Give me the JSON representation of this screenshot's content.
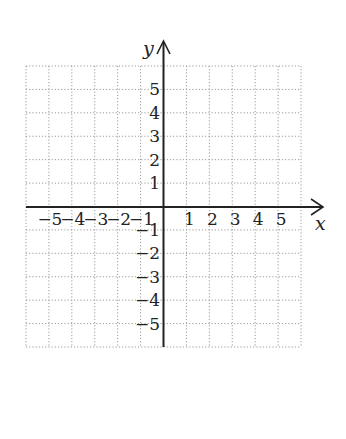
{
  "chart_data": {
    "type": "coordinate-grid",
    "title": "",
    "xlabel": "x",
    "ylabel": "y",
    "xlim": [
      -6,
      6
    ],
    "ylim": [
      -6,
      6
    ],
    "grid": true,
    "grid_style": "dotted",
    "x_ticks": [
      -5,
      -4,
      -3,
      -2,
      -1,
      1,
      2,
      3,
      4,
      5
    ],
    "y_ticks": [
      5,
      4,
      3,
      2,
      1,
      -1,
      -2,
      -3,
      -4,
      -5
    ],
    "x_tick_labels": [
      "−5",
      "−4",
      "−3",
      "−2",
      "−1",
      "1",
      "2",
      "3",
      "4",
      "5"
    ],
    "y_tick_labels": [
      "5",
      "4",
      "3",
      "2",
      "1",
      "−1",
      "−2",
      "−3",
      "−4",
      "−5"
    ],
    "series": []
  },
  "labels": {
    "x_axis": "x",
    "y_axis": "y"
  },
  "colors": {
    "axis": "#222222",
    "grid": "#9a9a9a",
    "background": "#ffffff"
  }
}
